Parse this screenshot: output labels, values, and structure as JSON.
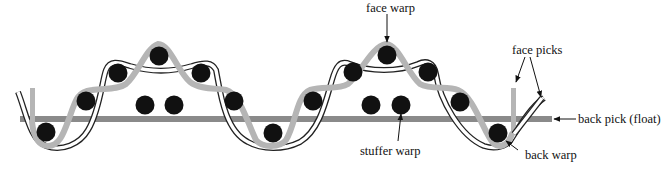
{
  "labels": {
    "face_warp": "face warp",
    "face_picks": "face picks",
    "back_pick": "back pick (float)",
    "stuffer_warp": "stuffer warp",
    "back_warp": "back warp"
  },
  "colors": {
    "face_warp_yarn": "#b5b5b5",
    "back_pick_yarn": "#8a8a8a",
    "picks": "#111111",
    "outline_yarn": "#222222",
    "arrows": "#111111"
  }
}
